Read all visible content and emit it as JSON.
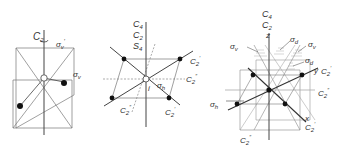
{
  "figure": {
    "panels": [
      {
        "id": "panel-c2v",
        "labels": {
          "axis": "C",
          "axis_sub": "2",
          "sigma_v_prime": "σ",
          "sigma_v_prime_sub": "v",
          "sigma_v_prime_mark": "′",
          "sigma_v": "σ",
          "sigma_v_sub": "v"
        }
      },
      {
        "id": "panel-d4h-square",
        "labels": {
          "c4": "C",
          "c4_sub": "4",
          "c2": "C",
          "c2_sub": "2",
          "s4": "S",
          "s4_sub": "4",
          "c2p_top": "C",
          "c2p_top_sub": "2",
          "c2p_top_mark": "′",
          "c2pp_right": "C",
          "c2pp_right_sub": "2",
          "c2pp_right_mark": "″",
          "sigma_h": "σ",
          "sigma_h_sub": "h",
          "inversion": "i",
          "c2pp_left": "C",
          "c2pp_left_sub": "2",
          "c2pp_left_mark": "″",
          "c2p_bottom": "C",
          "c2p_bottom_sub": "2",
          "c2p_bottom_mark": "′"
        }
      },
      {
        "id": "panel-d4h-planes",
        "labels": {
          "c4": "C",
          "c4_sub": "4",
          "c2": "C",
          "c2_sub": "2",
          "z": "z",
          "sigma_v_left": "σ",
          "sigma_v_left_sub": "v",
          "sigma_d_top": "σ",
          "sigma_d_top_sub": "d",
          "sigma_v_right": "σ",
          "sigma_v_right_sub": "v",
          "sigma_d_mid": "σ",
          "sigma_d_mid_sub": "d",
          "y": "y",
          "c2p_y": "C",
          "c2p_y_sub": "2",
          "c2p_y_mark": "′",
          "c2pp_right": "C",
          "c2pp_right_sub": "2",
          "c2pp_right_mark": "″",
          "sigma_h": "σ",
          "sigma_h_sub": "h",
          "x": "x",
          "c2p_x": "C",
          "c2p_x_sub": "2",
          "c2p_x_mark": "′",
          "c2pp_bottom": "C",
          "c2pp_bottom_sub": "2",
          "c2pp_bottom_mark": "″"
        }
      }
    ],
    "colors": {
      "line": "#666666",
      "axis": "#444444",
      "atom": "#111111",
      "text": "#333333"
    }
  }
}
